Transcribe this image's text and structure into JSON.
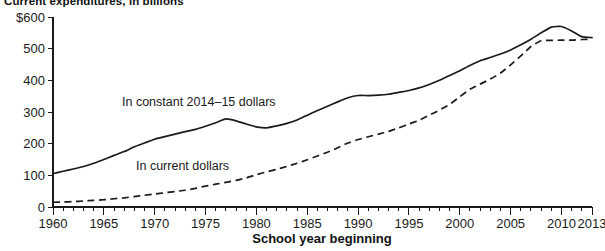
{
  "chart_data": {
    "type": "line",
    "title": "Current expenditures, in billions",
    "xlabel": "School year beginning",
    "ylabel": "",
    "xlim": [
      1960,
      2013
    ],
    "ylim": [
      0,
      600
    ],
    "grid": false,
    "legend_position": "inline-annotations",
    "ytick_labels": [
      "$600",
      "500",
      "400",
      "300",
      "200",
      "100",
      "0"
    ],
    "ytick_values": [
      600,
      500,
      400,
      300,
      200,
      100,
      0
    ],
    "xtick_labels": [
      "1960",
      "1965",
      "1970",
      "1975",
      "1980",
      "1985",
      "1990",
      "1995",
      "2000",
      "2005",
      "2010",
      "2013"
    ],
    "xtick_values": [
      1960,
      1965,
      1970,
      1975,
      1980,
      1985,
      1990,
      1995,
      2000,
      2005,
      2010,
      2013
    ],
    "minor_tick_interval": 1,
    "x": [
      1960,
      1961,
      1962,
      1963,
      1964,
      1965,
      1966,
      1967,
      1968,
      1969,
      1970,
      1971,
      1972,
      1973,
      1974,
      1975,
      1976,
      1977,
      1978,
      1979,
      1980,
      1981,
      1982,
      1983,
      1984,
      1985,
      1986,
      1987,
      1988,
      1989,
      1990,
      1991,
      1992,
      1993,
      1994,
      1995,
      1996,
      1997,
      1998,
      1999,
      2000,
      2001,
      2002,
      2003,
      2004,
      2005,
      2006,
      2007,
      2008,
      2009,
      2010,
      2011,
      2012,
      2013
    ],
    "series": [
      {
        "name": "In constant 2014–15 dollars",
        "style": "solid",
        "label_text": "In constant 2014–15 dollars",
        "values": [
          105,
          113,
          120,
          128,
          138,
          150,
          163,
          175,
          190,
          202,
          214,
          222,
          230,
          238,
          245,
          255,
          266,
          278,
          272,
          262,
          253,
          250,
          256,
          264,
          275,
          290,
          305,
          318,
          332,
          345,
          352,
          352,
          353,
          356,
          362,
          368,
          376,
          387,
          400,
          415,
          430,
          447,
          462,
          472,
          483,
          496,
          512,
          530,
          550,
          568,
          570,
          556,
          538,
          535
        ]
      },
      {
        "name": "In current dollars",
        "style": "dashed",
        "label_text": "In current dollars",
        "values": [
          15,
          16,
          17,
          19,
          21,
          23,
          26,
          29,
          33,
          37,
          41,
          45,
          49,
          53,
          59,
          66,
          72,
          78,
          84,
          92,
          102,
          111,
          119,
          128,
          138,
          149,
          161,
          173,
          187,
          202,
          213,
          222,
          230,
          239,
          250,
          262,
          274,
          290,
          306,
          324,
          348,
          372,
          388,
          404,
          423,
          449,
          477,
          507,
          525,
          526,
          527,
          527,
          529,
          530
        ]
      }
    ],
    "annotations": [
      {
        "text": "In constant 2014–15 dollars",
        "x": 1972,
        "y": 300
      },
      {
        "text": "In current dollars",
        "x": 1972,
        "y": 148
      }
    ]
  },
  "axes": {
    "x_axis_title": "School year beginning"
  },
  "colors": {
    "line": "#1a1a1a",
    "text": "#1a1a1a",
    "background": "#ffffff"
  }
}
